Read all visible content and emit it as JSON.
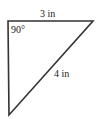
{
  "diagram": {
    "type": "right-triangle",
    "stroke_color": "#333333",
    "labels": {
      "top_side": "3 in",
      "right_angle": "90°",
      "hypotenuse": "4 in"
    },
    "vertices": {
      "top_left": [
        8,
        21
      ],
      "top_right": [
        93,
        21
      ],
      "bottom": [
        9,
        115
      ]
    }
  }
}
